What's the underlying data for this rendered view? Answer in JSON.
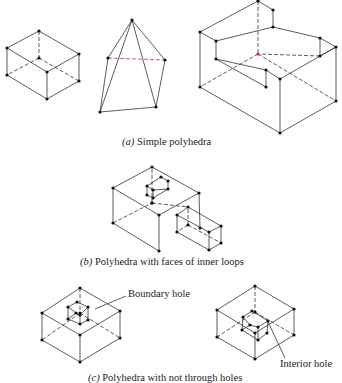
{
  "figure": {
    "captions": {
      "a": {
        "letter": "(a)",
        "text": " Simple polyhedra"
      },
      "b": {
        "letter": "(b)",
        "text": " Polyhedra with faces of inner loops"
      },
      "c": {
        "letter": "(c)",
        "text": " Polyhedra with not through holes"
      }
    },
    "labels": {
      "boundary_hole": "Boundary hole",
      "interior_hole": "Interior hole"
    },
    "colors": {
      "line": "#333333",
      "vertex": "#111111",
      "hidden_red": "#cc3333"
    },
    "shapes": [
      {
        "name": "box",
        "group": "a",
        "vertices": [
          [
            39,
            31
          ],
          [
            7,
            48
          ],
          [
            79,
            54
          ],
          [
            39,
            58
          ],
          [
            47,
            72
          ],
          [
            7,
            75
          ],
          [
            79,
            81
          ],
          [
            47,
            99
          ]
        ],
        "edges": [
          [
            0,
            1
          ],
          [
            0,
            2
          ],
          [
            1,
            4
          ],
          [
            2,
            4
          ],
          [
            1,
            5
          ],
          [
            2,
            6
          ],
          [
            4,
            7
          ],
          [
            5,
            7
          ],
          [
            6,
            7
          ]
        ],
        "hidden_edges": [
          [
            0,
            3
          ],
          [
            3,
            5
          ],
          [
            3,
            6
          ]
        ]
      },
      {
        "name": "pyramid",
        "group": "a",
        "vertices": [
          [
            132,
            20
          ],
          [
            108,
            58
          ],
          [
            165,
            60
          ],
          [
            100,
            112
          ],
          [
            156,
            107
          ]
        ],
        "edges": [
          [
            0,
            1
          ],
          [
            0,
            2
          ],
          [
            0,
            3
          ],
          [
            0,
            4
          ],
          [
            1,
            3
          ],
          [
            2,
            4
          ],
          [
            3,
            4
          ]
        ],
        "hidden_edges": [
          [
            1,
            2
          ]
        ]
      },
      {
        "name": "u-block",
        "group": "a",
        "vertices": [
          [
            258,
            1
          ],
          [
            273,
            10
          ],
          [
            200,
            32
          ],
          [
            216,
            41
          ],
          [
            273,
            27
          ],
          [
            320,
            38
          ],
          [
            336,
            47
          ],
          [
            258,
            54
          ],
          [
            320,
            56
          ],
          [
            216,
            59
          ],
          [
            266,
            70
          ],
          [
            280,
            79
          ],
          [
            200,
            87
          ],
          [
            266,
            87
          ],
          [
            336,
            101
          ],
          [
            280,
            133
          ]
        ],
        "edges": [
          [
            0,
            1
          ],
          [
            0,
            2
          ],
          [
            1,
            4
          ],
          [
            2,
            3
          ],
          [
            3,
            4
          ],
          [
            3,
            9
          ],
          [
            4,
            5
          ],
          [
            5,
            6
          ],
          [
            6,
            11
          ],
          [
            5,
            8
          ],
          [
            9,
            10
          ],
          [
            10,
            11
          ],
          [
            10,
            13
          ],
          [
            9,
            13
          ],
          [
            2,
            12
          ],
          [
            12,
            15
          ],
          [
            11,
            15
          ],
          [
            6,
            14
          ],
          [
            14,
            15
          ],
          [
            8,
            6
          ]
        ],
        "hidden_edges": [
          [
            0,
            7
          ],
          [
            7,
            12
          ],
          [
            7,
            14
          ],
          [
            8,
            7
          ]
        ]
      },
      {
        "name": "box-with-inner-loops",
        "group": "b",
        "vertices": [
          [
            152,
            167
          ],
          [
            113,
            188
          ],
          [
            199,
            193
          ],
          [
            159,
            215
          ],
          [
            113,
            223
          ],
          [
            159,
            251
          ],
          [
            152,
            203
          ],
          [
            188,
            207
          ],
          [
            177,
            215
          ],
          [
            221,
            226
          ],
          [
            177,
            232
          ],
          [
            209,
            232
          ],
          [
            221,
            243
          ],
          [
            209,
            250
          ],
          [
            200,
            228
          ],
          [
            188,
            225
          ]
        ],
        "edges": [
          [
            0,
            1
          ],
          [
            0,
            2
          ],
          [
            1,
            3
          ],
          [
            2,
            3
          ],
          [
            1,
            4
          ],
          [
            3,
            5
          ],
          [
            4,
            5
          ],
          [
            2,
            14
          ],
          [
            7,
            8
          ],
          [
            7,
            9
          ],
          [
            8,
            10
          ],
          [
            9,
            11
          ],
          [
            8,
            11
          ],
          [
            9,
            12
          ],
          [
            11,
            13
          ],
          [
            12,
            13
          ],
          [
            10,
            13
          ]
        ],
        "hidden_edges": [
          [
            4,
            6
          ],
          [
            6,
            0
          ],
          [
            6,
            7
          ],
          [
            15,
            10
          ],
          [
            15,
            12
          ],
          [
            15,
            7
          ]
        ],
        "inner": {
          "vertices": [
            [
              161,
              177
            ],
            [
              168,
              181
            ],
            [
              147,
              186
            ],
            [
              168,
              189
            ],
            [
              153,
              190
            ],
            [
              147,
              195
            ],
            [
              153,
              198
            ],
            [
              152,
              203
            ]
          ],
          "edges": [
            [
              0,
              1
            ],
            [
              0,
              2
            ],
            [
              1,
              3
            ],
            [
              2,
              4
            ],
            [
              3,
              4
            ],
            [
              2,
              5
            ],
            [
              4,
              6
            ],
            [
              5,
              6
            ],
            [
              3,
              6
            ]
          ]
        }
      },
      {
        "name": "box-boundary-hole",
        "group": "c",
        "vertices": [
          [
            80,
            288
          ],
          [
            42,
            313
          ],
          [
            120,
            311
          ],
          [
            80,
            335
          ],
          [
            42,
            340
          ],
          [
            120,
            338
          ],
          [
            80,
            362
          ],
          [
            80,
            313
          ]
        ],
        "edges": [
          [
            0,
            1
          ],
          [
            0,
            2
          ],
          [
            1,
            3
          ],
          [
            2,
            3
          ],
          [
            1,
            4
          ],
          [
            2,
            5
          ],
          [
            3,
            6
          ],
          [
            4,
            6
          ],
          [
            5,
            6
          ]
        ],
        "hidden_edges": [
          [
            0,
            7
          ],
          [
            7,
            4
          ],
          [
            7,
            5
          ]
        ],
        "hole": {
          "vertices": [
            [
              77,
              302
            ],
            [
              68,
              307
            ],
            [
              88,
              307
            ],
            [
              76,
              313
            ],
            [
              80,
              315
            ],
            [
              68,
              319
            ],
            [
              88,
              320
            ],
            [
              80,
              324
            ]
          ],
          "edges": [
            [
              0,
              1
            ],
            [
              0,
              2
            ],
            [
              1,
              3
            ],
            [
              2,
              4
            ],
            [
              3,
              4
            ],
            [
              1,
              5
            ],
            [
              3,
              5
            ],
            [
              4,
              7
            ],
            [
              2,
              6
            ],
            [
              6,
              7
            ],
            [
              5,
              7
            ]
          ]
        },
        "leader": [
          [
            95,
            309
          ],
          [
            126,
            296
          ]
        ]
      },
      {
        "name": "box-interior-hole",
        "group": "c",
        "vertices": [
          [
            255,
            286
          ],
          [
            217,
            310
          ],
          [
            294,
            309
          ],
          [
            255,
            333
          ],
          [
            217,
            337
          ],
          [
            294,
            335
          ],
          [
            255,
            359
          ],
          [
            255,
            312
          ]
        ],
        "edges": [
          [
            0,
            1
          ],
          [
            0,
            2
          ],
          [
            1,
            3
          ],
          [
            2,
            3
          ],
          [
            1,
            4
          ],
          [
            2,
            5
          ],
          [
            4,
            6
          ],
          [
            5,
            6
          ],
          [
            3,
            6
          ]
        ],
        "hidden_edges": [
          [
            0,
            7
          ],
          [
            7,
            4
          ],
          [
            7,
            5
          ]
        ],
        "hole": {
          "vertices": [
            [
              252,
              311
            ],
            [
              243,
              317
            ],
            [
              268,
              321
            ],
            [
              250,
              325
            ],
            [
              258,
              327
            ],
            [
              242,
              330
            ],
            [
              267,
              333
            ],
            [
              258,
              340
            ]
          ],
          "edges": [
            [
              0,
              1
            ],
            [
              0,
              2
            ],
            [
              1,
              3
            ],
            [
              2,
              4
            ],
            [
              3,
              4
            ],
            [
              1,
              5
            ],
            [
              5,
              7
            ],
            [
              4,
              7
            ],
            [
              2,
              6
            ],
            [
              6,
              7
            ],
            [
              3,
              5
            ]
          ]
        },
        "leader": [
          [
            268,
            322
          ],
          [
            285,
            358
          ]
        ]
      }
    ]
  }
}
